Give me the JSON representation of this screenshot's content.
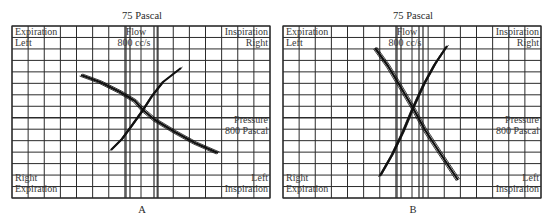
{
  "chart_data": [
    {
      "type": "line",
      "panel": "A",
      "title": "75 Pascal",
      "caption": "A",
      "labels": {
        "top_left": [
          "Expiration",
          "Left"
        ],
        "top_center": [
          "Flow",
          "800 cc/s"
        ],
        "top_right": [
          "Inspiration",
          "Right"
        ],
        "right_middle": [
          "Pressure",
          "800 Pascal"
        ],
        "bottom_left": [
          "Right",
          "Expiration"
        ],
        "bottom_right": [
          "Left",
          "Inspiration"
        ]
      },
      "grid": true,
      "series": [
        {
          "name": "Left lung loop",
          "points": [
            [
              81,
              75
            ],
            [
              100,
              82
            ],
            [
              120,
              92
            ],
            [
              135,
              101
            ],
            [
              143,
              110
            ],
            [
              155,
              120
            ],
            [
              175,
              132
            ],
            [
              195,
              143
            ],
            [
              218,
              153
            ]
          ]
        },
        {
          "name": "Right lung loop",
          "points": [
            [
              111,
              150
            ],
            [
              122,
              139
            ],
            [
              133,
              124
            ],
            [
              143,
              110
            ],
            [
              152,
              96
            ],
            [
              163,
              82
            ],
            [
              181,
              68
            ]
          ]
        }
      ]
    },
    {
      "type": "line",
      "panel": "B",
      "title": "75 Pascal",
      "caption": "B",
      "labels": {
        "top_left": [
          "Expiration",
          "Left"
        ],
        "top_center": [
          "Flow",
          "800 cc/s"
        ],
        "top_right": [
          "Inspiration",
          "Right"
        ],
        "right_middle": [
          "Pressure",
          "800 Pascal"
        ],
        "bottom_left": [
          "Right",
          "Expiration"
        ],
        "bottom_right": [
          "Left",
          "Inspiration"
        ]
      },
      "grid": true,
      "series": [
        {
          "name": "Left lung loop",
          "points": [
            [
              375,
              48
            ],
            [
              388,
              66
            ],
            [
              400,
              86
            ],
            [
              413,
              108
            ],
            [
              425,
              130
            ],
            [
              440,
              153
            ],
            [
              458,
              180
            ]
          ]
        },
        {
          "name": "Right lung loop",
          "points": [
            [
              380,
              176
            ],
            [
              392,
              155
            ],
            [
              403,
              132
            ],
            [
              413,
              108
            ],
            [
              424,
              84
            ],
            [
              435,
              64
            ],
            [
              447,
              46
            ]
          ]
        }
      ]
    }
  ]
}
